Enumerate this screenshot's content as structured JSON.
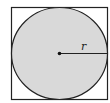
{
  "figure": {
    "labels": {
      "radius": "r"
    },
    "colors": {
      "circle_fill": "#d9d9d9",
      "stroke": "#222222",
      "background": "#ffffff"
    }
  }
}
